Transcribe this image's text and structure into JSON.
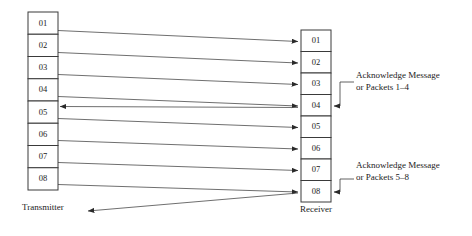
{
  "figure": {
    "type": "sequence-diagram",
    "background": "#ffffff",
    "line_color": "#4a4a4a",
    "box_stroke": "#3a3a3a",
    "text_color": "#1a1a1a",
    "width": 472,
    "height": 236
  },
  "transmitter": {
    "label": "Transmitter",
    "label_x": 22,
    "label_y": 210,
    "column": {
      "x": 28,
      "y": 12,
      "width": 30,
      "cell_height": 22.25,
      "count": 8
    },
    "packets": [
      {
        "id": "01",
        "index": 0
      },
      {
        "id": "02",
        "index": 1
      },
      {
        "id": "03",
        "index": 2
      },
      {
        "id": "04",
        "index": 3
      },
      {
        "id": "05",
        "index": 4
      },
      {
        "id": "06",
        "index": 5
      },
      {
        "id": "07",
        "index": 6
      },
      {
        "id": "08",
        "index": 7
      }
    ]
  },
  "receiver": {
    "label": "Receiver",
    "label_x": 300,
    "label_y": 212,
    "column": {
      "x": 301,
      "y": 30,
      "width": 30,
      "cell_height": 21.5,
      "count": 8
    },
    "packets": [
      {
        "id": "01",
        "index": 0
      },
      {
        "id": "02",
        "index": 1
      },
      {
        "id": "03",
        "index": 2
      },
      {
        "id": "04",
        "index": 3
      },
      {
        "id": "05",
        "index": 4
      },
      {
        "id": "06",
        "index": 5
      },
      {
        "id": "07",
        "index": 6
      },
      {
        "id": "08",
        "index": 7
      }
    ]
  },
  "data_arrows": [
    {
      "name": "packet-01-transfer",
      "x1": 58,
      "y1": 30.5,
      "x2": 298,
      "y2": 41.5
    },
    {
      "name": "packet-02-transfer",
      "x1": 58,
      "y1": 52.5,
      "x2": 298,
      "y2": 63.0
    },
    {
      "name": "packet-03-transfer",
      "x1": 58,
      "y1": 74.5,
      "x2": 298,
      "y2": 84.5
    },
    {
      "name": "packet-04-transfer",
      "x1": 58,
      "y1": 96.5,
      "x2": 298,
      "y2": 106.0
    },
    {
      "name": "packet-05-transfer",
      "x1": 58,
      "y1": 118.5,
      "x2": 298,
      "y2": 127.5
    },
    {
      "name": "packet-06-transfer",
      "x1": 58,
      "y1": 140.5,
      "x2": 298,
      "y2": 149.0
    },
    {
      "name": "packet-07-transfer",
      "x1": 58,
      "y1": 162.5,
      "x2": 298,
      "y2": 170.5
    },
    {
      "name": "packet-08-transfer",
      "x1": 58,
      "y1": 184.5,
      "x2": 298,
      "y2": 192.0
    }
  ],
  "ack_arrows": [
    {
      "name": "ack-1-4-return",
      "x1": 298,
      "y1": 107.5,
      "x2": 60,
      "y2": 106.5
    },
    {
      "name": "ack-5-8-return",
      "x1": 298,
      "y1": 193.0,
      "x2": 88,
      "y2": 211.0
    }
  ],
  "annotations": [
    {
      "name": "ack-note-1-4",
      "line1": "Acknowledge Message",
      "line2": "or Packets 1–4",
      "text_x": 356,
      "text_y": 78,
      "leader": {
        "x_start": 354,
        "y_top": 82,
        "x_corner": 340,
        "y_bottom": 106,
        "x_end": 334
      }
    },
    {
      "name": "ack-note-5-8",
      "line1": "Acknowledge Message",
      "line2": "or Packets 5–8",
      "text_x": 356,
      "text_y": 168,
      "leader": {
        "x_start": 354,
        "y_top": 179,
        "x_corner": 340,
        "y_bottom": 192,
        "x_end": 334
      }
    }
  ]
}
